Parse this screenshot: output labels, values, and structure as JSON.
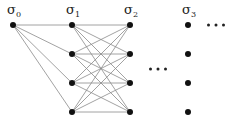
{
  "diagram": {
    "type": "layered-graph",
    "layers": [
      {
        "label": "σ",
        "subscript": "0",
        "x": 13,
        "nodes_y": [
          25
        ]
      },
      {
        "label": "σ",
        "subscript": "1",
        "x": 72,
        "nodes_y": [
          25,
          54,
          83,
          112
        ]
      },
      {
        "label": "σ",
        "subscript": "2",
        "x": 130,
        "nodes_y": [
          25,
          54,
          83,
          112
        ]
      },
      {
        "label": "σ",
        "subscript": "3",
        "x": 188,
        "nodes_y": [
          25,
          54,
          83,
          112
        ]
      }
    ],
    "edges": [
      {
        "from_layer": 0,
        "to_layer": 1,
        "pattern": "fan-out"
      },
      {
        "from_layer": 1,
        "to_layer": 2,
        "pattern": "complete-bipartite"
      }
    ],
    "ellipses": [
      {
        "text": "…",
        "x": 158,
        "y": 69,
        "meaning": "continuation between σ2 and σ3"
      },
      {
        "text": "…",
        "x": 216,
        "y": 25,
        "meaning": "continuation after σ3"
      }
    ],
    "colors": {
      "node": "#111111",
      "edge": "#8a8a8a",
      "background": "#ffffff"
    }
  }
}
